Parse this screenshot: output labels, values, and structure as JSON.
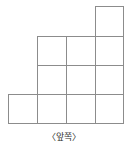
{
  "figure": {
    "caption": "〈앞쪽〉",
    "caption_meaning": "front",
    "line_color": "#8c8c8c",
    "cell_fill": "#ffffff",
    "background": "#ffffff",
    "stroke_width": 1,
    "unit_cell_px": 29,
    "total_cells": 11
  },
  "grid": {
    "columns": 4,
    "rows": 4,
    "origin_x": 8,
    "origin_y": 6,
    "col_edges": [
      8,
      37,
      66,
      95,
      123
    ],
    "row_edges": [
      6,
      36,
      65,
      94,
      123
    ],
    "row_labels": [
      "row-1",
      "row-2",
      "row-3",
      "row-4"
    ],
    "column_labels": [
      "col-1",
      "col-2",
      "col-3",
      "col-4"
    ],
    "occupancy": [
      [
        0,
        0,
        0,
        1
      ],
      [
        0,
        1,
        1,
        1
      ],
      [
        0,
        1,
        1,
        1
      ],
      [
        1,
        1,
        1,
        1
      ]
    ],
    "row_counts": [
      1,
      3,
      3,
      4
    ],
    "column_counts": [
      1,
      3,
      3,
      4
    ]
  },
  "chart_data": {
    "type": "table",
    "xlabel": "",
    "ylabel": "",
    "categories": [
      "col-1",
      "col-2",
      "col-3",
      "col-4"
    ],
    "values": [
      1,
      3,
      3,
      4
    ],
    "annotations": [
      "〈앞쪽〉"
    ],
    "grid": true,
    "legend": "none"
  },
  "cells": [
    {
      "id": "cell-r1c4",
      "row": 1,
      "col": 4,
      "x": 95,
      "y": 6,
      "w": 28,
      "h": 30
    },
    {
      "id": "cell-r2c2",
      "row": 2,
      "col": 2,
      "x": 37,
      "y": 36,
      "w": 29,
      "h": 29
    },
    {
      "id": "cell-r2c3",
      "row": 2,
      "col": 3,
      "x": 66,
      "y": 36,
      "w": 29,
      "h": 29
    },
    {
      "id": "cell-r2c4",
      "row": 2,
      "col": 4,
      "x": 95,
      "y": 36,
      "w": 28,
      "h": 29
    },
    {
      "id": "cell-r3c2",
      "row": 3,
      "col": 2,
      "x": 37,
      "y": 65,
      "w": 29,
      "h": 29
    },
    {
      "id": "cell-r3c3",
      "row": 3,
      "col": 3,
      "x": 66,
      "y": 65,
      "w": 29,
      "h": 29
    },
    {
      "id": "cell-r3c4",
      "row": 3,
      "col": 4,
      "x": 95,
      "y": 65,
      "w": 28,
      "h": 29
    },
    {
      "id": "cell-r4c1",
      "row": 4,
      "col": 1,
      "x": 8,
      "y": 94,
      "w": 29,
      "h": 29
    },
    {
      "id": "cell-r4c2",
      "row": 4,
      "col": 2,
      "x": 37,
      "y": 94,
      "w": 29,
      "h": 29
    },
    {
      "id": "cell-r4c3",
      "row": 4,
      "col": 3,
      "x": 66,
      "y": 94,
      "w": 29,
      "h": 29
    },
    {
      "id": "cell-r4c4",
      "row": 4,
      "col": 4,
      "x": 95,
      "y": 94,
      "w": 28,
      "h": 29
    }
  ]
}
